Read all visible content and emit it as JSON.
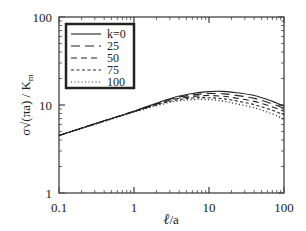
{
  "chart_data": {
    "type": "line",
    "title": "",
    "xlabel": "ℓ/a",
    "ylabel": "σ√(πa) / K_m",
    "xscale": "log",
    "yscale": "log",
    "xlim": [
      0.1,
      100
    ],
    "ylim": [
      1,
      100
    ],
    "xticks": [
      "0.1",
      "1",
      "10",
      "100"
    ],
    "yticks": [
      "1",
      "10",
      "100"
    ],
    "grid": false,
    "legend_position": "upper left",
    "x": [
      0.1,
      0.3,
      1,
      3,
      6,
      10,
      15,
      20,
      40,
      70,
      100
    ],
    "series": [
      {
        "name": "k=0",
        "style": "solid",
        "values": [
          4.5,
          6.1,
          8.5,
          11.8,
          13.5,
          14.2,
          14.3,
          14.0,
          12.8,
          11.0,
          9.7
        ]
      },
      {
        "name": "25",
        "style": "long-dash",
        "values": [
          4.5,
          6.1,
          8.5,
          11.6,
          13.0,
          13.5,
          13.4,
          13.1,
          11.9,
          10.3,
          9.2
        ]
      },
      {
        "name": "50",
        "style": "dash",
        "values": [
          4.5,
          6.1,
          8.4,
          11.3,
          12.5,
          12.8,
          12.6,
          12.2,
          11.0,
          9.5,
          8.5
        ]
      },
      {
        "name": "75",
        "style": "short-dash",
        "values": [
          4.5,
          6.1,
          8.4,
          11.0,
          12.0,
          12.1,
          11.8,
          11.4,
          10.1,
          8.7,
          7.7
        ]
      },
      {
        "name": "100",
        "style": "dotted",
        "values": [
          4.5,
          6.0,
          8.3,
          10.7,
          11.5,
          11.5,
          11.1,
          10.6,
          9.3,
          7.9,
          6.9
        ]
      }
    ]
  },
  "axes": {
    "x_title_main": "ℓ",
    "x_title_rest": "/a",
    "y_title": "σ√(πa) / K",
    "y_title_sub": "m",
    "x_tick_labels": [
      "0.1",
      "1",
      "10",
      "100"
    ],
    "y_tick_labels": [
      "1",
      "10",
      "100"
    ]
  },
  "legend": {
    "entries": [
      "k=0",
      "25",
      "50",
      "75",
      "100"
    ]
  }
}
